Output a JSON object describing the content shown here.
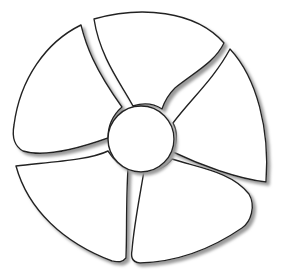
{
  "illustration": {
    "subject": "five-blade fan outline",
    "colors": {
      "background": "#ffffff",
      "fill": "#ffffff",
      "stroke": "#222222",
      "shadow": "#9a9a9a"
    },
    "hub": {
      "cx": 141,
      "cy": 139,
      "r": 33
    },
    "blades": [
      {
        "name": "blade-top",
        "d": "M94,19 C140,6 195,10 224,43 C215,62 195,72 175,88 C168,95 164,103 162,109 C153,103 142,103 133,106 C122,85 100,58 94,19 Z"
      },
      {
        "name": "blade-right",
        "d": "M230,49 C257,78 270,130 266,182 C238,179 200,165 173,152 C177,142 178,132 173,123 C190,100 214,79 230,49 Z"
      },
      {
        "name": "blade-bottom-right",
        "d": "M172,159 C200,168 232,172 249,194 C256,206 251,222 242,228 C210,250 175,262 140,263 C131,262 131,256 132,250 C134,225 140,195 144,171 C156,171 166,167 172,159 Z"
      },
      {
        "name": "blade-bottom-left",
        "d": "M16,166 C50,162 90,160 108,151 C114,160 120,166 128,169 C126,200 127,232 126,258 C122,263 118,262 112,261 C64,243 28,210 16,166 Z"
      },
      {
        "name": "blade-left",
        "d": "M81,25 C86,45 94,68 122,107 C113,115 108,126 108,138 C80,148 45,158 23,151 C14,146 12,136 14,125 C20,79 46,42 81,25 Z"
      }
    ]
  }
}
